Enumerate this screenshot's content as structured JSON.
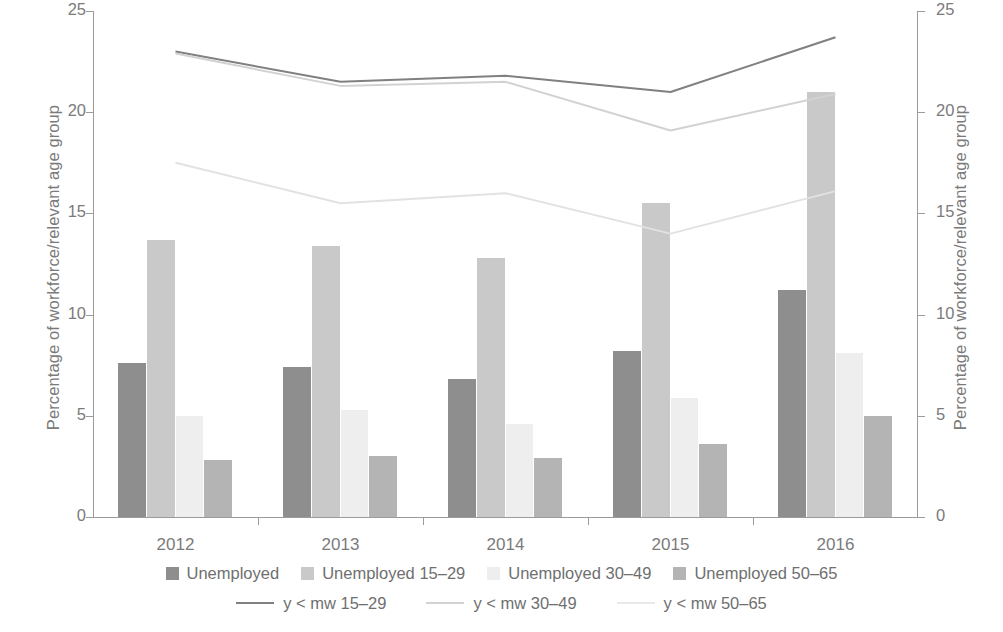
{
  "chart_data": {
    "type": "bar",
    "title": "",
    "subtitle": "",
    "xlabel": "",
    "ylabel": "Percentage of workforce/relevant age group",
    "y2label": "Percentage of workforce/relevant age group",
    "categories": [
      "2012",
      "2013",
      "2014",
      "2015",
      "2016"
    ],
    "ylim": [
      0,
      25
    ],
    "y2lim": [
      0,
      25
    ],
    "yticks": [
      "0",
      "5",
      "10",
      "15",
      "20",
      "25"
    ],
    "ytick_values": [
      0,
      5,
      10,
      15,
      20,
      25
    ],
    "grid": false,
    "legend_position": "bottom",
    "series": [
      {
        "name": "Unemployed",
        "kind": "bar",
        "color": "#8e8e8e",
        "values": [
          7.6,
          7.4,
          6.8,
          8.2,
          11.2
        ]
      },
      {
        "name": "Unemployed 15–29",
        "kind": "bar",
        "color": "#c9c9c9",
        "values": [
          13.7,
          13.4,
          12.8,
          15.5,
          21.0
        ]
      },
      {
        "name": "Unemployed 30–49",
        "kind": "bar",
        "color": "#eeeeee",
        "values": [
          5.0,
          5.3,
          4.6,
          5.9,
          8.1
        ]
      },
      {
        "name": "Unemployed 50–65",
        "kind": "bar",
        "color": "#b4b4b4",
        "values": [
          2.8,
          3.0,
          2.9,
          3.6,
          5.0
        ]
      },
      {
        "name": "y < mw 15–29",
        "kind": "line",
        "color": "#808080",
        "values": [
          23.0,
          21.5,
          21.8,
          21.0,
          23.7
        ]
      },
      {
        "name": "y < mw 30–49",
        "kind": "line",
        "color": "#d2d2d2",
        "values": [
          22.9,
          21.3,
          21.5,
          19.1,
          20.9
        ]
      },
      {
        "name": "y < mw 50–65",
        "kind": "line",
        "color": "#e2e2e2",
        "values": [
          17.5,
          15.5,
          16.0,
          14.0,
          16.1
        ]
      }
    ]
  },
  "legend": {
    "bars": [
      {
        "label": "Unemployed",
        "color": "#8e8e8e"
      },
      {
        "label": "Unemployed 15–29",
        "color": "#c9c9c9"
      },
      {
        "label": "Unemployed 30–49",
        "color": "#eeeeee"
      },
      {
        "label": "Unemployed 50–65",
        "color": "#b4b4b4"
      }
    ],
    "lines": [
      {
        "label": "y < mw 15–29",
        "color": "#808080"
      },
      {
        "label": "y < mw 30–49",
        "color": "#d2d2d2"
      },
      {
        "label": "y < mw 50–65",
        "color": "#e9e9e9"
      }
    ]
  }
}
